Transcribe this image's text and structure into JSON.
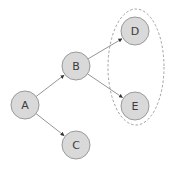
{
  "diagram": {
    "type": "directed-graph",
    "nodes": [
      {
        "id": "A",
        "label": "A",
        "cx": 25,
        "cy": 105,
        "r": 14
      },
      {
        "id": "B",
        "label": "B",
        "cx": 76,
        "cy": 66,
        "r": 14
      },
      {
        "id": "C",
        "label": "C",
        "cx": 76,
        "cy": 145,
        "r": 14
      },
      {
        "id": "D",
        "label": "D",
        "cx": 135,
        "cy": 31,
        "r": 14
      },
      {
        "id": "E",
        "label": "E",
        "cx": 135,
        "cy": 106,
        "r": 14
      }
    ],
    "edges": [
      {
        "from": "A",
        "to": "B"
      },
      {
        "from": "A",
        "to": "C"
      },
      {
        "from": "B",
        "to": "D"
      },
      {
        "from": "B",
        "to": "E"
      }
    ],
    "groups": [
      {
        "id": "DE-group",
        "members": [
          "D",
          "E"
        ],
        "style": "dashed-ellipse",
        "cx": 136,
        "cy": 67,
        "rx": 28,
        "ry": 58
      }
    ],
    "colors": {
      "node_fill": "#d9d9d9",
      "node_stroke": "#9a9a9a",
      "label": "#3c3c3c",
      "edge": "#7a7a7a",
      "arrowhead": "#333333",
      "group_stroke": "#8a8a8a"
    }
  }
}
